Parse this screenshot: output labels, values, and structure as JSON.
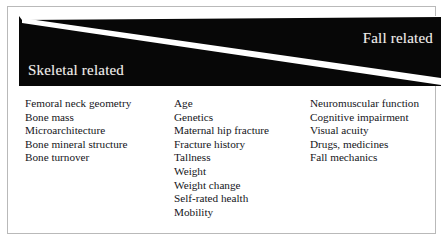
{
  "figure": {
    "banner": {
      "left_label": "Skeletal related",
      "right_label": "Fall related",
      "background_color": "#070707",
      "divider_color": "#ffffff",
      "text_color": "#f2f0ec"
    },
    "frame": {
      "border_color": "#b9b9b9",
      "background_color": "#ffffff"
    },
    "columns": [
      {
        "id": "skeletal-factors",
        "items": [
          "Femoral neck geometry",
          "Bone mass",
          "Microarchitecture",
          "Bone mineral structure",
          "Bone turnover"
        ]
      },
      {
        "id": "shared-factors",
        "items": [
          "Age",
          "Genetics",
          "Maternal hip fracture",
          "Fracture history",
          "Tallness",
          "Weight",
          "Weight change",
          "Self-rated health",
          "Mobility"
        ]
      },
      {
        "id": "fall-factors",
        "items": [
          "Neuromuscular function",
          "Cognitive impairment",
          "Visual acuity",
          "Drugs, medicines",
          "Fall mechanics"
        ]
      }
    ]
  }
}
